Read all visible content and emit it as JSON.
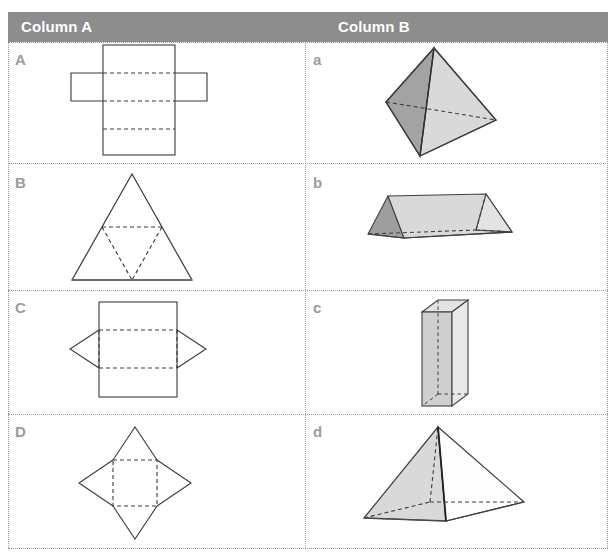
{
  "header": {
    "column_a_label": "Column A",
    "column_b_label": "Column B",
    "bar_color": "#8d8d8d",
    "text_color": "#ffffff"
  },
  "grid": {
    "line_color": "#9a9a9a",
    "line_style": "dotted",
    "column_divider_x": 305,
    "row_divider_y": [
      163,
      290,
      414,
      548
    ]
  },
  "colors": {
    "net_stroke": "#3a3a3a",
    "net_dash_stroke": "#3a3a3a",
    "solid_stroke": "#3f3f3f",
    "face_light": "#e0e0e0",
    "face_mid": "#c9c9c9",
    "face_dark": "#9e9e9e",
    "face_white": "#ffffff",
    "label_gray": "#9c9c9c"
  },
  "rows": [
    {
      "net": {
        "label": "A",
        "name": "net-cuboid-cross",
        "description": "Net of a rectangular prism: tall central rectangle with two side flaps and dashed fold lines"
      },
      "solid": {
        "label": "a",
        "name": "solid-octahedron",
        "description": "Octahedron (triangular bipyramid view) with shaded left faces and light right faces"
      }
    },
    {
      "net": {
        "label": "B",
        "name": "net-tetrahedron-triangle",
        "description": "Net of a tetrahedron: large equilateral triangle with inner inverted dashed triangle"
      },
      "solid": {
        "label": "b",
        "name": "solid-triangular-prism",
        "description": "Triangular prism lying on its long side"
      }
    },
    {
      "net": {
        "label": "C",
        "name": "net-triangular-prism",
        "description": "Net with central rectangle, dashed fold lines and two triangular side flaps"
      },
      "solid": {
        "label": "c",
        "name": "solid-tall-cuboid",
        "description": "Tall narrow rectangular prism (cuboid) standing upright"
      }
    },
    {
      "net": {
        "label": "D",
        "name": "net-square-pyramid-star",
        "description": "Star-shaped net: dashed square with four triangular flaps"
      },
      "solid": {
        "label": "d",
        "name": "solid-square-pyramid",
        "description": "Square-based pyramid with hidden edges dashed"
      }
    }
  ]
}
